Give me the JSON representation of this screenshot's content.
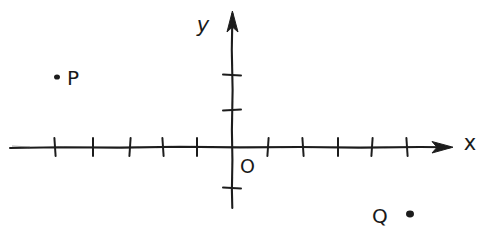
{
  "figure": {
    "kind": "hand-drawn-coordinate-plane",
    "background_color": "#ffffff",
    "ink_color": "#1f1f1f",
    "width": 485,
    "height": 237
  },
  "axes": {
    "x_axis": {
      "label": "x",
      "label_x": 470,
      "label_y": 150,
      "line_y": 147,
      "line_x_start": 10,
      "line_x_end": 452,
      "arrow_end": "right",
      "tick_positions_px": [
        55,
        93,
        130,
        163,
        197,
        268,
        303,
        338,
        372,
        407
      ],
      "tick_count": 10,
      "tick_half_height": 9
    },
    "y_axis": {
      "label": "y",
      "label_x": 203,
      "label_y": 32,
      "line_x": 232,
      "line_y_start": 12,
      "line_y_end": 208,
      "arrow_end": "top",
      "tick_positions_px": [
        75,
        110,
        188
      ],
      "tick_count": 3,
      "tick_half_width": 9
    },
    "origin": {
      "label": "O",
      "label_x": 240,
      "label_y": 173,
      "x": 232,
      "y": 147
    }
  },
  "points": [
    {
      "name": "P",
      "label": "P",
      "dot_x": 57,
      "dot_y": 77,
      "dot_r": 3,
      "label_x": 67,
      "label_y": 85
    },
    {
      "name": "Q",
      "label": "Q",
      "dot_x": 410,
      "dot_y": 214,
      "dot_r": 4,
      "label_x": 372,
      "label_y": 223
    }
  ],
  "colors": {
    "ink": "#1f1f1f",
    "ink_soft": "#2b2b2b",
    "paper": "#ffffff"
  }
}
